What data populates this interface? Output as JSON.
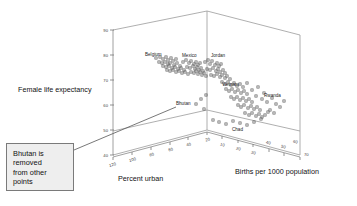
{
  "chart_data": {
    "type": "scatter",
    "title": "",
    "projection": "3d",
    "xlabel": "Percent urban",
    "ylabel": "Female life expectancy",
    "zlabel": "Births per 1000 population",
    "axes": {
      "percent_urban": {
        "label": "Percent urban",
        "ticks": [
          120,
          100,
          80,
          60,
          40,
          20
        ],
        "range": [
          120,
          20
        ],
        "reversed": true
      },
      "female_life_expectancy": {
        "label": "Female life expectancy",
        "ticks": [
          90,
          80,
          70,
          60,
          50,
          40
        ],
        "range": [
          40,
          90
        ],
        "reversed": false
      },
      "births_per_1000": {
        "label": "Births per 1000 population",
        "ticks": [
          10,
          20,
          30,
          40,
          50,
          60,
          70
        ],
        "range": [
          10,
          70
        ],
        "reversed": false
      }
    },
    "grid": false,
    "legend": null,
    "annotations": [
      {
        "name": "bhutan-callout",
        "text": "Bhutan is removed from other points",
        "lines": [
          "Bhutan is",
          "removed",
          "from other",
          "points"
        ],
        "points_to": "Bhutan"
      }
    ],
    "labeled_points": [
      {
        "name": "Belgium",
        "percent_urban": 97,
        "female_life_expectancy": 80,
        "births_per_1000": 12
      },
      {
        "name": "Mexico",
        "percent_urban": 75,
        "female_life_expectancy": 77,
        "births_per_1000": 27
      },
      {
        "name": "Jordan",
        "percent_urban": 70,
        "female_life_expectancy": 73,
        "births_per_1000": 39
      },
      {
        "name": "Vietnam",
        "percent_urban": 20,
        "female_life_expectancy": 67,
        "births_per_1000": 31
      },
      {
        "name": "Rwanda",
        "percent_urban": 6,
        "female_life_expectancy": 55,
        "births_per_1000": 51
      },
      {
        "name": "Chad",
        "percent_urban": 21,
        "female_life_expectancy": 48,
        "births_per_1000": 44
      },
      {
        "name": "Bhutan",
        "percent_urban": 5,
        "female_life_expectancy": 54,
        "births_per_1000": 40
      }
    ],
    "point_labels": [
      "Belgium",
      "Mexico",
      "Jordan",
      "Vietnam",
      "Rwanda",
      "Chad",
      "Bhutan"
    ],
    "marker_style": "open-square",
    "n_points": 104,
    "points_px": [
      [
        156,
        58
      ],
      [
        160,
        57
      ],
      [
        163,
        59
      ],
      [
        166,
        57
      ],
      [
        168,
        60
      ],
      [
        171,
        58
      ],
      [
        173,
        61
      ],
      [
        176,
        59
      ],
      [
        159,
        62
      ],
      [
        162,
        63
      ],
      [
        165,
        62
      ],
      [
        168,
        64
      ],
      [
        170,
        63
      ],
      [
        174,
        65
      ],
      [
        177,
        63
      ],
      [
        180,
        66
      ],
      [
        163,
        66
      ],
      [
        166,
        67
      ],
      [
        169,
        66
      ],
      [
        172,
        68
      ],
      [
        175,
        67
      ],
      [
        178,
        69
      ],
      [
        181,
        68
      ],
      [
        184,
        70
      ],
      [
        167,
        70
      ],
      [
        170,
        71
      ],
      [
        173,
        70
      ],
      [
        176,
        72
      ],
      [
        179,
        71
      ],
      [
        182,
        73
      ],
      [
        185,
        72
      ],
      [
        188,
        74
      ],
      [
        183,
        62
      ],
      [
        186,
        60
      ],
      [
        189,
        63
      ],
      [
        191,
        61
      ],
      [
        194,
        64
      ],
      [
        196,
        62
      ],
      [
        198,
        65
      ],
      [
        200,
        63
      ],
      [
        187,
        67
      ],
      [
        190,
        68
      ],
      [
        193,
        66
      ],
      [
        195,
        69
      ],
      [
        197,
        67
      ],
      [
        199,
        70
      ],
      [
        201,
        68
      ],
      [
        203,
        71
      ],
      [
        191,
        72
      ],
      [
        194,
        73
      ],
      [
        196,
        71
      ],
      [
        198,
        74
      ],
      [
        200,
        72
      ],
      [
        202,
        75
      ],
      [
        204,
        73
      ],
      [
        206,
        76
      ],
      [
        205,
        62
      ],
      [
        208,
        60
      ],
      [
        210,
        64
      ],
      [
        212,
        61
      ],
      [
        215,
        65
      ],
      [
        217,
        63
      ],
      [
        219,
        66
      ],
      [
        221,
        64
      ],
      [
        207,
        69
      ],
      [
        210,
        70
      ],
      [
        213,
        68
      ],
      [
        216,
        71
      ],
      [
        218,
        69
      ],
      [
        220,
        72
      ],
      [
        223,
        70
      ],
      [
        225,
        73
      ],
      [
        211,
        75
      ],
      [
        214,
        76
      ],
      [
        217,
        74
      ],
      [
        220,
        77
      ],
      [
        222,
        75
      ],
      [
        225,
        78
      ],
      [
        227,
        76
      ],
      [
        230,
        79
      ],
      [
        222,
        82
      ],
      [
        225,
        84
      ],
      [
        228,
        82
      ],
      [
        231,
        85
      ],
      [
        234,
        83
      ],
      [
        237,
        86
      ],
      [
        240,
        84
      ],
      [
        243,
        87
      ],
      [
        226,
        89
      ],
      [
        229,
        91
      ],
      [
        232,
        89
      ],
      [
        235,
        92
      ],
      [
        238,
        90
      ],
      [
        241,
        93
      ],
      [
        244,
        91
      ],
      [
        247,
        94
      ],
      [
        231,
        97
      ],
      [
        234,
        99
      ],
      [
        237,
        97
      ],
      [
        240,
        100
      ],
      [
        243,
        98
      ],
      [
        246,
        101
      ],
      [
        249,
        99
      ],
      [
        252,
        102
      ],
      [
        238,
        105
      ],
      [
        241,
        107
      ],
      [
        244,
        105
      ],
      [
        248,
        108
      ],
      [
        251,
        106
      ],
      [
        254,
        109
      ],
      [
        257,
        107
      ],
      [
        260,
        110
      ],
      [
        245,
        113
      ],
      [
        249,
        115
      ],
      [
        252,
        113
      ],
      [
        256,
        116
      ],
      [
        259,
        114
      ],
      [
        262,
        117
      ],
      [
        265,
        115
      ],
      [
        268,
        112
      ],
      [
        213,
        120
      ],
      [
        219,
        122
      ],
      [
        226,
        124
      ],
      [
        233,
        121
      ],
      [
        240,
        123
      ],
      [
        247,
        125
      ],
      [
        254,
        122
      ],
      [
        261,
        119
      ],
      [
        196,
        104
      ],
      [
        201,
        99
      ],
      [
        206,
        95
      ],
      [
        256,
        96
      ],
      [
        262,
        99
      ],
      [
        267,
        102
      ],
      [
        272,
        98
      ],
      [
        276,
        104
      ],
      [
        280,
        107
      ],
      [
        284,
        101
      ],
      [
        270,
        110
      ],
      [
        274,
        113
      ],
      [
        252,
        90
      ],
      [
        258,
        87
      ],
      [
        264,
        93
      ],
      [
        247,
        83
      ]
    ],
    "bhutan_marker_px": [
      204,
      109
    ]
  },
  "callout": {
    "text": "Bhutan is removed from other points"
  }
}
